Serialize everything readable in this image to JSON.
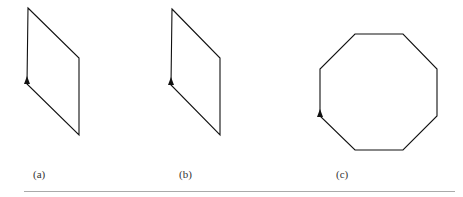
{
  "figures": [
    {
      "id": "a",
      "label": "(a)",
      "shape": "parallelogram",
      "points": "28,8 79,58 79,135 27,84",
      "arrow": {
        "x": 27,
        "y": 81
      }
    },
    {
      "id": "b",
      "label": "(b)",
      "shape": "parallelogram",
      "points": "172,9 220,58 220,135 171,85",
      "arrow": {
        "x": 171,
        "y": 82
      }
    },
    {
      "id": "c",
      "label": "(c)",
      "shape": "octagon",
      "points": "355,34 403,34 437,69 437,116 403,150 355,150 320,116 320,69",
      "arrow": {
        "x": 320,
        "y": 114
      }
    }
  ],
  "colors": {
    "stroke": "#111111",
    "rule": "#aaaaaa"
  }
}
